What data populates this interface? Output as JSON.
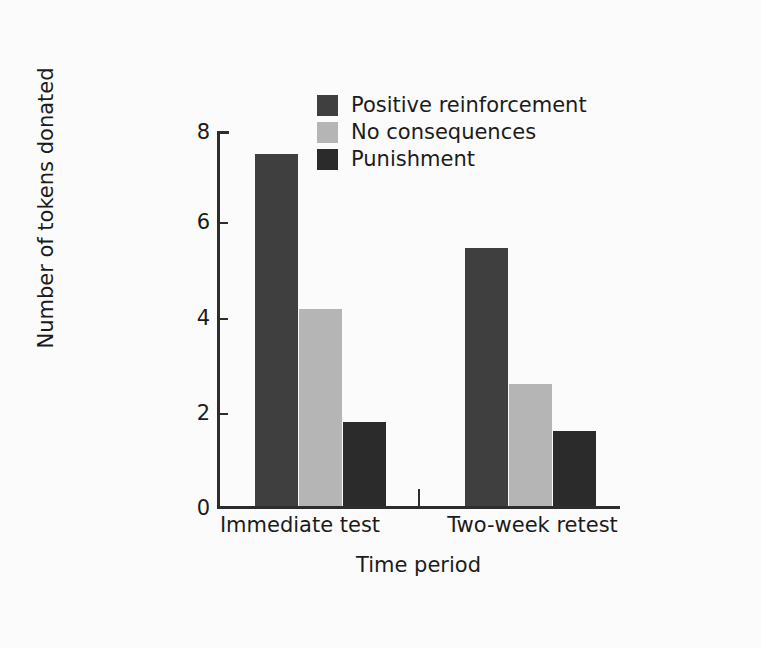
{
  "chart_data": {
    "type": "bar",
    "title": "",
    "subtitle": "",
    "xlabel": "Time period",
    "ylabel": "Number of tokens donated",
    "categories": [
      "Immediate test",
      "Two-week retest"
    ],
    "series": [
      {
        "name": "Positive reinforcement",
        "color": "#3f3f3f",
        "values": [
          7.5,
          5.5
        ]
      },
      {
        "name": "No consequences",
        "color": "#b5b5b5",
        "values": [
          4.2,
          2.6
        ]
      },
      {
        "name": "Punishment",
        "color": "#2b2b2b",
        "values": [
          1.8,
          1.6
        ]
      }
    ],
    "ylim": [
      0,
      8
    ],
    "yticks": [
      0,
      2,
      4,
      6,
      8
    ],
    "ytick_labels": [
      "0",
      "2",
      "4",
      "6",
      "8"
    ],
    "grid": false,
    "legend_position": "top-center"
  },
  "legend": {
    "items": [
      {
        "label": "Positive reinforcement",
        "color": "#3f3f3f"
      },
      {
        "label": "No consequences",
        "color": "#b5b5b5"
      },
      {
        "label": "Punishment",
        "color": "#2b2b2b"
      }
    ]
  },
  "axes": {
    "y_title": "Number of tokens donated",
    "x_title": "Time period",
    "y_tick_0": "0",
    "y_tick_2": "2",
    "y_tick_4": "4",
    "y_tick_6": "6",
    "y_tick_8": "8",
    "x_cat_1": "Immediate test",
    "x_cat_2": "Two-week retest"
  }
}
